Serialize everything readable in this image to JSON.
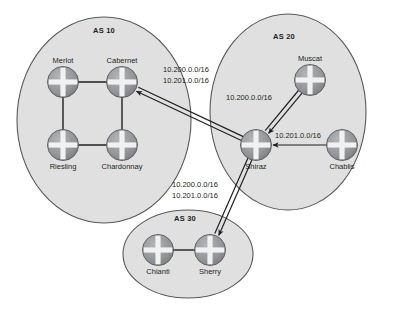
{
  "diagram": {
    "type": "network-topology",
    "background_color": "#ffffff",
    "palette": {
      "as_fill": "#e0e0e0",
      "as_stroke": "#58595b",
      "router_body": "#939598",
      "router_cross": "#f1f1f2",
      "router_stroke": "#58595b",
      "link_color": "#231f20",
      "text_color": "#231f20"
    },
    "autonomous_systems": [
      {
        "id": "as-10",
        "label": "AS 10",
        "shape": "ellipse",
        "cx": 104,
        "cy": 120,
        "rx": 87,
        "ry": 103,
        "label_x": 104,
        "label_y": 33,
        "routers": [
          {
            "id": "merlot",
            "name": "Merlot",
            "x": 63,
            "y": 82,
            "label_pos": "above"
          },
          {
            "id": "cabernet",
            "name": "Cabernet",
            "x": 122,
            "y": 82,
            "label_pos": "above"
          },
          {
            "id": "riesling",
            "name": "Riesling",
            "x": 63,
            "y": 145,
            "label_pos": "below"
          },
          {
            "id": "chardonnay",
            "name": "Chardonnay",
            "x": 122,
            "y": 145,
            "label_pos": "below"
          }
        ],
        "internal_links": [
          {
            "from": "merlot",
            "to": "cabernet"
          },
          {
            "from": "merlot",
            "to": "riesling"
          },
          {
            "from": "cabernet",
            "to": "chardonnay"
          },
          {
            "from": "riesling",
            "to": "chardonnay"
          }
        ]
      },
      {
        "id": "as-20",
        "label": "AS 20",
        "shape": "ellipse",
        "cx": 288,
        "cy": 112,
        "rx": 78,
        "ry": 98,
        "label_x": 284,
        "label_y": 39,
        "routers": [
          {
            "id": "muscat",
            "name": "Muscat",
            "x": 310,
            "y": 80,
            "label_pos": "above"
          },
          {
            "id": "shiraz",
            "name": "Shiraz",
            "x": 256,
            "y": 145,
            "label_pos": "below"
          },
          {
            "id": "chablis",
            "name": "Chablis",
            "x": 342,
            "y": 145,
            "label_pos": "below"
          }
        ],
        "internal_links": []
      },
      {
        "id": "as-30",
        "label": "AS 30",
        "shape": "ellipse",
        "cx": 188,
        "cy": 254,
        "rx": 65,
        "ry": 44,
        "label_x": 185,
        "label_y": 221,
        "routers": [
          {
            "id": "chianti",
            "name": "Chianti",
            "x": 158,
            "y": 250,
            "label_pos": "below"
          },
          {
            "id": "sherry",
            "name": "Sherry",
            "x": 210,
            "y": 250,
            "label_pos": "below"
          }
        ],
        "internal_links": [
          {
            "from": "chianti",
            "to": "sherry"
          }
        ]
      }
    ],
    "advertisements": [
      {
        "id": "shiraz-to-cabernet",
        "from": "shiraz",
        "to": "cabernet",
        "arrow": "to",
        "double_line": true,
        "prefixes": [
          "10.200.0.0/16",
          "10.201.0.0/16"
        ],
        "label_x": 163,
        "label_y": 72
      },
      {
        "id": "muscat-to-shiraz",
        "from": "muscat",
        "to": "shiraz",
        "arrow": "to",
        "double_line": true,
        "prefixes": [
          "10.200.0.0/16"
        ],
        "label_x": 226,
        "label_y": 100
      },
      {
        "id": "chablis-to-shiraz",
        "from": "chablis",
        "to": "shiraz",
        "arrow": "to",
        "double_line": false,
        "prefixes": [
          "10.201.0.0/16"
        ],
        "label_x": 275,
        "label_y": 138
      },
      {
        "id": "shiraz-to-sherry",
        "from": "shiraz",
        "to": "sherry",
        "arrow": "to",
        "double_line": true,
        "prefixes": [
          "10.200.0.0/16",
          "10.201.0.0/16"
        ],
        "label_x": 172,
        "label_y": 187
      }
    ]
  }
}
